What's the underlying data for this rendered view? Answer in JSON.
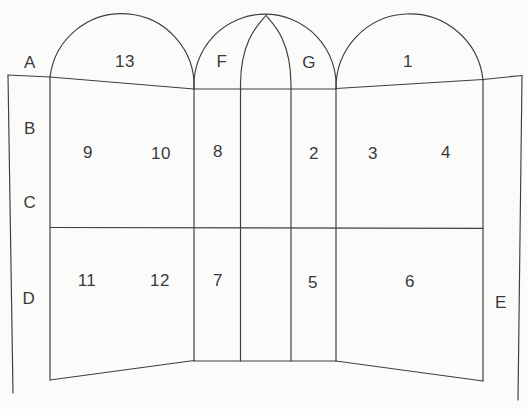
{
  "colors": {
    "background": "#fbfbfa",
    "line": "#3e3e3e",
    "text": "#3a3a3a"
  },
  "labels": {
    "a": "A",
    "b": "B",
    "c": "C",
    "d": "D",
    "e": "E",
    "f": "F",
    "g": "G"
  },
  "panels": {
    "p1": "1",
    "p2": "2",
    "p3": "3",
    "p4": "4",
    "p5": "5",
    "p6": "6",
    "p7": "7",
    "p8": "8",
    "p9": "9",
    "p10": "10",
    "p11": "11",
    "p12": "12",
    "p13": "13"
  }
}
